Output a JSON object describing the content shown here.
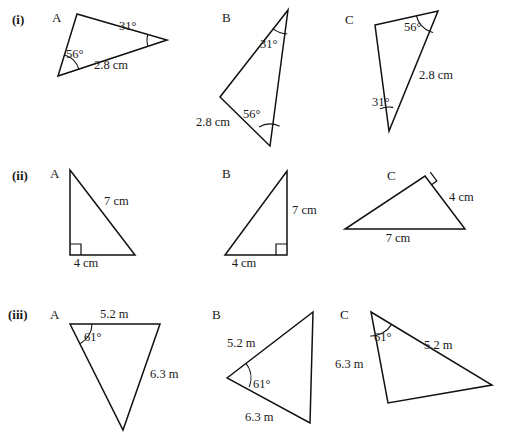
{
  "page": {
    "top_partial_text": "",
    "width": 510,
    "height": 440,
    "ink_color": "#111111",
    "background": "#ffffff"
  },
  "rows": [
    {
      "label": "(i)",
      "label_pos": {
        "x": 12,
        "y": 12
      },
      "triangles": [
        {
          "name": "A",
          "name_pos": {
            "x": 52,
            "y": 10
          },
          "points": "77,14 58,76 167,40",
          "angle_arcs": [
            {
              "cx": 58,
              "cy": 76,
              "r": 22,
              "a1": -72,
              "a2": -17
            },
            {
              "cx": 167,
              "cy": 40,
              "r": 20,
              "a1": 161,
              "a2": 196
            }
          ],
          "right_angles": [],
          "labels": [
            {
              "text": "56°",
              "x": 66,
              "y": 47,
              "anchor": "start"
            },
            {
              "text": "31°",
              "x": 119,
              "y": 19,
              "anchor": "start"
            },
            {
              "text": "2.8 cm",
              "x": 94,
              "y": 58,
              "anchor": "start"
            }
          ]
        },
        {
          "name": "B",
          "name_pos": {
            "x": 222,
            "y": 10
          },
          "points": "288,10 220,97 270,146",
          "angle_arcs": [
            {
              "cx": 288,
              "cy": 10,
              "r": 24,
              "a1": 92,
              "a2": 128
            },
            {
              "cx": 270,
              "cy": 146,
              "r": 22,
              "a1": -120,
              "a2": -64
            }
          ],
          "right_angles": [],
          "labels": [
            {
              "text": "31°",
              "x": 260,
              "y": 37,
              "anchor": "start"
            },
            {
              "text": "56°",
              "x": 243,
              "y": 107,
              "anchor": "start"
            },
            {
              "text": "2.8 cm",
              "x": 196,
              "y": 115,
              "anchor": "start"
            }
          ]
        },
        {
          "name": "C",
          "name_pos": {
            "x": 345,
            "y": 12
          },
          "points": "375,25 438,11 389,131",
          "angle_arcs": [
            {
              "cx": 438,
              "cy": 11,
              "r": 22,
              "a1": 103,
              "a2": 168
            },
            {
              "cx": 389,
              "cy": 131,
              "r": 24,
              "a1": -112,
              "a2": -80
            }
          ],
          "right_angles": [],
          "labels": [
            {
              "text": "56°",
              "x": 404,
              "y": 20,
              "anchor": "start"
            },
            {
              "text": "31°",
              "x": 372,
              "y": 95,
              "anchor": "start"
            },
            {
              "text": "2.8 cm",
              "x": 419,
              "y": 68,
              "anchor": "start"
            }
          ]
        }
      ]
    },
    {
      "label": "(ii)",
      "label_pos": {
        "x": 12,
        "y": 168
      },
      "triangles": [
        {
          "name": "A",
          "name_pos": {
            "x": 50,
            "y": 166
          },
          "points": "70,170 70,255 135,255",
          "angle_arcs": [],
          "right_angles": [
            {
              "x": 70,
              "y": 255,
              "dx": 1,
              "dy": -1,
              "size": 11
            }
          ],
          "labels": [
            {
              "text": "7 cm",
              "x": 104,
              "y": 194,
              "anchor": "start"
            },
            {
              "text": "4 cm",
              "x": 86,
              "y": 256,
              "anchor": "middle"
            }
          ]
        },
        {
          "name": "B",
          "name_pos": {
            "x": 222,
            "y": 166
          },
          "points": "287,171 287,255 225,255",
          "angle_arcs": [],
          "right_angles": [
            {
              "x": 287,
              "y": 255,
              "dx": -1,
              "dy": -1,
              "size": 11
            }
          ],
          "labels": [
            {
              "text": "7 cm",
              "x": 292,
              "y": 203,
              "anchor": "start"
            },
            {
              "text": "4 cm",
              "x": 244,
              "y": 256,
              "anchor": "middle"
            }
          ]
        },
        {
          "name": "C",
          "name_pos": {
            "x": 387,
            "y": 168
          },
          "points": "425,176 465,229 345,229",
          "angle_arcs": [],
          "right_angles": [
            {
              "x": 425,
              "y": 176,
              "dx": 0.6,
              "dy": 1,
              "size": 11,
              "rotate": -37
            }
          ],
          "labels": [
            {
              "text": "4 cm",
              "x": 449,
              "y": 190,
              "anchor": "start"
            },
            {
              "text": "7 cm",
              "x": 398,
              "y": 231,
              "anchor": "middle"
            }
          ]
        }
      ]
    },
    {
      "label": "(iii)",
      "label_pos": {
        "x": 8,
        "y": 307
      },
      "triangles": [
        {
          "name": "A",
          "name_pos": {
            "x": 50,
            "y": 307
          },
          "points": "70,324 160,324 123,430",
          "angle_arcs": [
            {
              "cx": 70,
              "cy": 324,
              "r": 22,
              "a1": 0,
              "a2": 62
            }
          ],
          "right_angles": [],
          "labels": [
            {
              "text": "5.2 m",
              "x": 100,
              "y": 307,
              "anchor": "start"
            },
            {
              "text": "61°",
              "x": 84,
              "y": 330,
              "anchor": "start"
            },
            {
              "text": "6.3 m",
              "x": 150,
              "y": 367,
              "anchor": "start"
            }
          ]
        },
        {
          "name": "B",
          "name_pos": {
            "x": 212,
            "y": 307
          },
          "points": "227,378 313,312 310,423",
          "angle_arcs": [
            {
              "cx": 227,
              "cy": 378,
              "r": 24,
              "a1": -38,
              "a2": 22
            }
          ],
          "right_angles": [],
          "labels": [
            {
              "text": "5.2 m",
              "x": 227,
              "y": 336,
              "anchor": "start"
            },
            {
              "text": "61°",
              "x": 253,
              "y": 377,
              "anchor": "start"
            },
            {
              "text": "6.3 m",
              "x": 245,
              "y": 410,
              "anchor": "start"
            }
          ]
        },
        {
          "name": "C",
          "name_pos": {
            "x": 340,
            "y": 307
          },
          "points": "371,312 492,385 388,403",
          "angle_arcs": [
            {
              "cx": 371,
              "cy": 312,
              "r": 24,
              "a1": 31,
              "a2": 92
            }
          ],
          "right_angles": [],
          "labels": [
            {
              "text": "61°",
              "x": 374,
              "y": 330,
              "anchor": "start"
            },
            {
              "text": "5.2 m",
              "x": 424,
              "y": 338,
              "anchor": "start"
            },
            {
              "text": "6.3 m",
              "x": 335,
              "y": 357,
              "anchor": "start"
            }
          ]
        }
      ]
    }
  ]
}
